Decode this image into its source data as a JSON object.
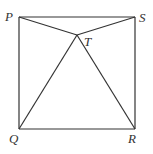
{
  "diagram": {
    "type": "geometry",
    "colors": {
      "line": "#333333",
      "background": "#ffffff"
    },
    "points": {
      "P": {
        "label": "P",
        "x": 19,
        "y": 17
      },
      "S": {
        "label": "S",
        "x": 135,
        "y": 17
      },
      "Q": {
        "label": "Q",
        "x": 19,
        "y": 129
      },
      "R": {
        "label": "R",
        "x": 135,
        "y": 129
      },
      "T": {
        "label": "T",
        "x": 77,
        "y": 35
      }
    },
    "segments": [
      "PS",
      "SR",
      "RQ",
      "QP",
      "PT",
      "ST",
      "QT",
      "RT"
    ]
  }
}
